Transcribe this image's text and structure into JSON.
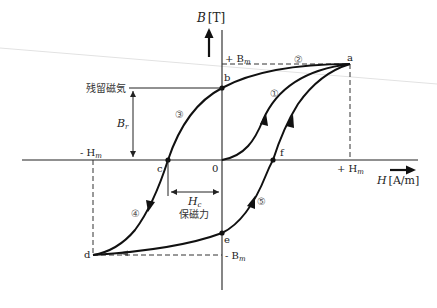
{
  "colors": {
    "curve": "#111111",
    "axis": "#222222",
    "dash": "#333333",
    "artifact": "#dddddd",
    "background": "#ffffff"
  },
  "axes": {
    "y_label_var": "B",
    "y_label_unit": "[T]",
    "x_label_var": "H",
    "x_label_unit": "[A/m]",
    "origin": "0"
  },
  "levels": {
    "plus_bm": "+ B",
    "plus_bm_sub": "m",
    "minus_bm": "- B",
    "minus_bm_sub": "m",
    "plus_hm": "+ H",
    "plus_hm_sub": "m",
    "minus_hm": "- H",
    "minus_hm_sub": "m"
  },
  "points": {
    "a": "a",
    "b": "b",
    "c": "c",
    "d": "d",
    "e": "e",
    "f": "f"
  },
  "segments": {
    "s1": "①",
    "s2": "②",
    "s3": "③",
    "s4": "④",
    "s5": "⑤"
  },
  "annotations": {
    "remanence_label": "残留磁気",
    "br_var": "B",
    "br_sub": "r",
    "hc_var": "H",
    "hc_sub": "c",
    "coercivity_label": "保磁力"
  }
}
